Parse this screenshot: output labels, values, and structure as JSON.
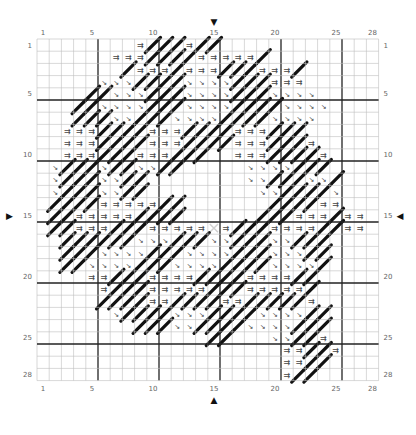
{
  "chart_data": {
    "type": "cross-stitch-pattern",
    "title": "",
    "cols": 28,
    "rows": 28,
    "grid_origin": [
      37,
      39
    ],
    "cell_size": 12.2,
    "major_lines_every": 5,
    "col_labels": [
      {
        "n": 1,
        "c": 1
      },
      {
        "n": 5,
        "c": 5
      },
      {
        "n": 10,
        "c": 10
      },
      {
        "n": 15,
        "c": 15
      },
      {
        "n": 20,
        "c": 20
      },
      {
        "n": 25,
        "c": 25
      },
      {
        "n": 28,
        "c": 28
      }
    ],
    "row_labels": [
      {
        "n": 1,
        "r": 1
      },
      {
        "n": 5,
        "r": 5
      },
      {
        "n": 10,
        "r": 10
      },
      {
        "n": 15,
        "r": 15
      },
      {
        "n": 20,
        "r": 20
      },
      {
        "n": 25,
        "r": 25
      },
      {
        "n": 28,
        "r": 28
      }
    ],
    "center": {
      "col": 15,
      "row": 15
    },
    "center_markers": {
      "top": "▼",
      "bottom": "▲",
      "left": "▶",
      "right": "◀"
    },
    "legend": {
      "=": "double-arrow symbol (⇉)",
      "v": "small diagonal arrow (↘)",
      "/": "full diagonal backstitch",
      "x": "center cross marker",
      ".": "empty"
    },
    "colors": {
      "grid": "#bdbdbd",
      "major": "#222222",
      "stitch": "#111111",
      "symbol": "#444444",
      "center": "#d0d0d0"
    },
    "rows_data": [
      "........=///=//.............",
      "......===////=====/.........",
      "......./===/===///===/......",
      ".....vvv////vvvv///===......",
      "....//vvv///vvvv///vvvv.....",
      "...//vvvv///vvvv////vvvv....",
      "...///vv///vvvv////vvvv.....",
      "..===////===////===///......",
      "..===////===////===///=.....",
      "..===///===///..===////=....",
      ".v///v//vv//.....vvvv///....",
      ".v///vv//........vv///vv/...",
      ".v///vv//.........vv////v...",
      ".////=====//.......////==...",
      ".//=====////......///===/==.",
      ".//===///=====x=///====//==.",
      "..//////vvv///vv///vv///....",
      "..///vvvv///vvvv///vvv//....",
      "..//vvvv///vvvv////vvvv/....",
      "....==///====////====//.....",
      ".....=///=====///=====/.....",
      ".....////==////==/////=.....",
      "......v////vvv////vvvv//....",
      "........///vv////vvvv///....",
      "..............//...vv//=....",
      "....................==//=...",
      "....................==//....",
      "....................=//....."
    ]
  }
}
